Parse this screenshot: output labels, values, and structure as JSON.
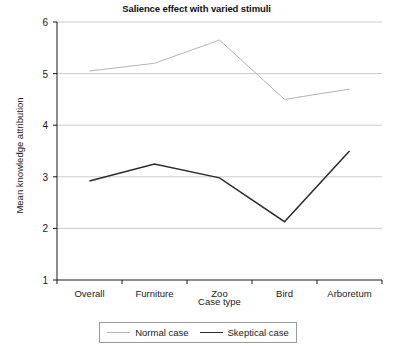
{
  "chart_data": {
    "type": "line",
    "title": "Salience effect with varied stimuli",
    "xlabel": "Case type",
    "ylabel": "Mean knowledge attribution",
    "categories": [
      "Overall",
      "Furniture",
      "Zoo",
      "Bird",
      "Arboretum"
    ],
    "ylim": [
      1,
      6
    ],
    "yticks": [
      1,
      2,
      3,
      4,
      5,
      6
    ],
    "ytick_labels": [
      "1",
      "2",
      "3",
      "4",
      "5",
      "6"
    ],
    "grid": true,
    "grid_axis": "y",
    "legend_position": "bottom",
    "series": [
      {
        "name": "Normal case",
        "color": "#b4b4b4",
        "values": [
          5.05,
          5.2,
          5.65,
          4.5,
          4.7
        ]
      },
      {
        "name": "Skeptical case",
        "color": "#2b2b2b",
        "values": [
          2.92,
          3.25,
          2.98,
          2.13,
          3.5
        ]
      }
    ]
  }
}
